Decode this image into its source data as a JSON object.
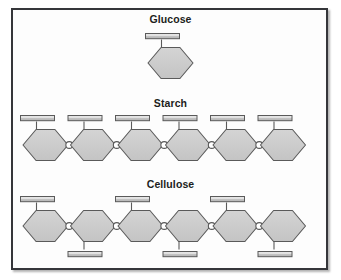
{
  "figure": {
    "background_color": "#ffffff",
    "frame_border_color": "#35363a",
    "panel_fill": "#fdfdfd"
  },
  "style": {
    "ring_fill": "#c9c9c9",
    "ring_stroke": "#5a5a5a",
    "bar_fill_top": "#e4e4e4",
    "bar_fill_bottom": "#b9b9b9",
    "bar_stroke": "#5a5a5a",
    "link_fill": "#ffffff",
    "link_stroke": "#5a5a5a",
    "stem_stroke": "#5a5a5a",
    "title_color": "#1c1d20"
  },
  "sections": [
    {
      "id": "glucose",
      "title": "Glucose",
      "unit_count": 1,
      "link_count": 0,
      "hydroxyl_orientation": "all-up",
      "description": "A single hexagonal glucose ring with one bar (hydroxyl group) projecting upward."
    },
    {
      "id": "starch",
      "title": "Starch",
      "unit_count": 6,
      "link_count": 5,
      "hydroxyl_orientation": "all-up",
      "description": "Six glucose rings linked in a chain; every bar points upward (alpha linkages)."
    },
    {
      "id": "cellulose",
      "title": "Cellulose",
      "unit_count": 6,
      "link_count": 5,
      "hydroxyl_orientation": "alternating-up-down",
      "description": "Six glucose rings linked in a chain; bars alternate up, down, up, down, up, down (beta linkages)."
    }
  ],
  "chart_data": {
    "type": "diagram",
    "rows": [
      {
        "label": "Glucose",
        "rings": 1,
        "links": 0,
        "bar_directions": [
          "up"
        ]
      },
      {
        "label": "Starch",
        "rings": 6,
        "links": 5,
        "bar_directions": [
          "up",
          "up",
          "up",
          "up",
          "up",
          "up"
        ]
      },
      {
        "label": "Cellulose",
        "rings": 6,
        "links": 5,
        "bar_directions": [
          "up",
          "down",
          "up",
          "down",
          "up",
          "down"
        ]
      }
    ]
  }
}
